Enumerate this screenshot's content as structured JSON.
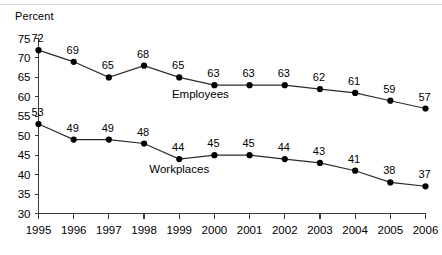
{
  "chart_data": {
    "type": "line",
    "title": "",
    "xlabel": "",
    "ylabel": "Percent",
    "ylim": [
      30,
      75
    ],
    "yticks": [
      30,
      35,
      40,
      45,
      50,
      55,
      60,
      65,
      70,
      75
    ],
    "grid": false,
    "legend_position": "inline-annotation",
    "categories": [
      "1995",
      "1996",
      "1997",
      "1998",
      "1999",
      "2000",
      "2001",
      "2002",
      "2003",
      "2004",
      "2005",
      "2006"
    ],
    "x": [
      1995,
      1996,
      1997,
      1998,
      1999,
      2000,
      2001,
      2002,
      2003,
      2004,
      2005,
      2006
    ],
    "series": [
      {
        "name": "Employees",
        "values": [
          72,
          69,
          65,
          68,
          65,
          63,
          63,
          63,
          62,
          61,
          59,
          57
        ],
        "color": "#000000"
      },
      {
        "name": "Workplaces",
        "values": [
          53,
          49,
          49,
          48,
          44,
          45,
          45,
          44,
          43,
          41,
          38,
          37
        ],
        "color": "#000000"
      }
    ],
    "annotations": [
      {
        "text": "Employees",
        "x": 1999.6,
        "y": 59.6
      },
      {
        "text": "Workplaces",
        "x": 1999.0,
        "y": 40.3
      }
    ]
  },
  "colors": {
    "background": "#ffffff",
    "axis": "#3a3a3a",
    "line": "#2b2b2b",
    "marker": "#000000",
    "top_rule": "#d8d8d8"
  }
}
